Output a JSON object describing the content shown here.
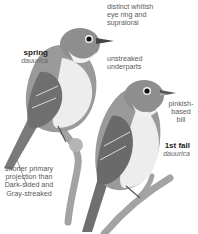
{
  "birds": [
    {
      "age_label": "spring",
      "subspecies": "dauurica"
    },
    {
      "age_label": "1st fall",
      "subspecies": "dauurica"
    }
  ],
  "annotations": {
    "eye_ring": [
      "distinct whitish",
      "eye ring and",
      "supraloral"
    ],
    "underparts": [
      "unstreaked",
      "underparts"
    ],
    "bill": [
      "pinkish-",
      "based",
      "bill"
    ],
    "primary_projection": [
      "shorter primary",
      "projection than",
      "Dark-sided and",
      "Gray-streaked"
    ]
  },
  "colors": {
    "background": "#ffffff",
    "bird_upperparts": "#8a8a8a",
    "bird_underparts": "#ededed",
    "branch": "#9a9a9a"
  }
}
